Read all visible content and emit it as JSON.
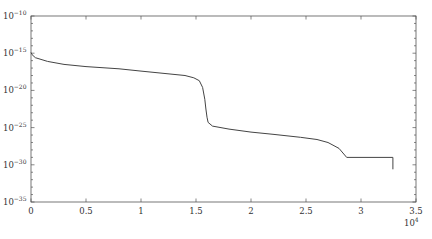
{
  "chart_data": {
    "type": "line",
    "title": "",
    "xlabel": "",
    "ylabel": "",
    "x_multiplier_label": "10^4",
    "x_scale": "linear",
    "y_scale": "log",
    "xlim": [
      0,
      3.5
    ],
    "ylim_exponent": [
      -35,
      -10
    ],
    "x_ticks": [
      "0",
      "0.5",
      "1",
      "1.5",
      "2",
      "2.5",
      "3",
      "3.5"
    ],
    "y_ticks": [
      "10^-10",
      "10^-15",
      "10^-20",
      "10^-25",
      "10^-30",
      "10^-35"
    ],
    "grid": false,
    "legend": null,
    "line_color": "#444444",
    "series": [
      {
        "name": "series-1",
        "x_units": "x 10^4",
        "y_log10": true,
        "points": [
          [
            0.0,
            -14.9
          ],
          [
            0.01,
            -15.2
          ],
          [
            0.04,
            -15.6
          ],
          [
            0.15,
            -16.1
          ],
          [
            0.3,
            -16.5
          ],
          [
            0.5,
            -16.8
          ],
          [
            0.8,
            -17.1
          ],
          [
            1.0,
            -17.4
          ],
          [
            1.2,
            -17.7
          ],
          [
            1.4,
            -18.0
          ],
          [
            1.48,
            -18.3
          ],
          [
            1.53,
            -18.7
          ],
          [
            1.56,
            -19.6
          ],
          [
            1.58,
            -21.2
          ],
          [
            1.59,
            -22.5
          ],
          [
            1.6,
            -23.6
          ],
          [
            1.61,
            -24.3
          ],
          [
            1.65,
            -24.8
          ],
          [
            1.8,
            -25.2
          ],
          [
            2.0,
            -25.6
          ],
          [
            2.2,
            -25.9
          ],
          [
            2.45,
            -26.3
          ],
          [
            2.6,
            -26.6
          ],
          [
            2.7,
            -27.0
          ],
          [
            2.8,
            -27.8
          ],
          [
            2.87,
            -29.0
          ],
          [
            3.0,
            -29.0
          ],
          [
            3.2,
            -29.0
          ],
          [
            3.29,
            -29.0
          ],
          [
            3.29,
            -30.6
          ]
        ]
      }
    ]
  }
}
